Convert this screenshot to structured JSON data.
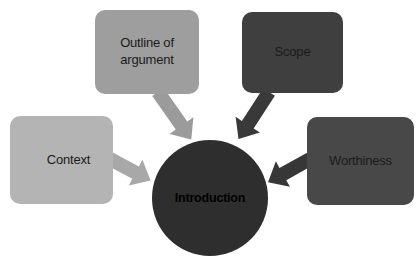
{
  "diagram": {
    "type": "converging-radial",
    "center": {
      "label": "Introduction"
    },
    "nodes": [
      {
        "label": "Outline of\nargument",
        "position": "top-left"
      },
      {
        "label": "Scope",
        "position": "top-right"
      },
      {
        "label": "Context",
        "position": "left"
      },
      {
        "label": "Worthiness",
        "position": "right"
      }
    ]
  },
  "colors": {
    "background": "#ffffff",
    "outline_box": "#9e9e9e",
    "scope_box": "#3f3f3f",
    "context_box": "#b4b4b4",
    "worthiness_box": "#484848",
    "circle": "#2e2e2e",
    "outline_arrow": "#9b9b9b",
    "scope_arrow": "#393939",
    "context_arrow": "#a8a8a8",
    "worthiness_arrow": "#373737",
    "label_text": "#1b1b1b",
    "center_text": "#000000"
  }
}
